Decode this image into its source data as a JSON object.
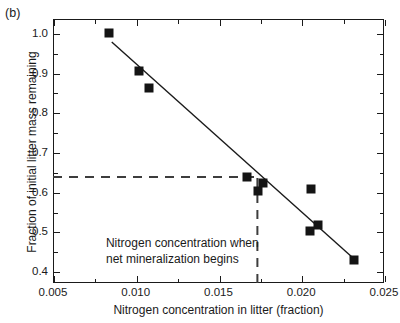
{
  "figure": {
    "panel_label": "(b)"
  },
  "chart_data": {
    "type": "scatter",
    "title": "",
    "xlabel": "Nitrogen concentration in litter (fraction)",
    "ylabel": "Fraction of initial litter mass remaining",
    "xlim": [
      0.005,
      0.025
    ],
    "ylim": [
      0.37,
      1.035
    ],
    "grid": false,
    "legend": null,
    "xticks": [
      0.005,
      0.01,
      0.015,
      0.02,
      0.025
    ],
    "xticklabels": [
      "0.005",
      "0.010",
      "0.015",
      "0.020",
      "0.025"
    ],
    "xminorticks": [
      0.0075,
      0.0125,
      0.0175,
      0.0225
    ],
    "yticks": [
      0.4,
      0.5,
      0.6,
      0.7,
      0.8,
      0.9,
      1.0
    ],
    "yticklabels": [
      "0.4",
      "0.5",
      "0.6",
      "0.7",
      "0.8",
      "0.9",
      "1.0"
    ],
    "yminorticks": [
      0.45,
      0.55,
      0.65,
      0.75,
      0.85,
      0.95
    ],
    "marker_style": "filled-square",
    "marker_color": "#141414",
    "points": [
      {
        "x": 0.0084,
        "y": 1.0
      },
      {
        "x": 0.0102,
        "y": 0.905
      },
      {
        "x": 0.0108,
        "y": 0.862
      },
      {
        "x": 0.0167,
        "y": 0.637
      },
      {
        "x": 0.0174,
        "y": 0.602
      },
      {
        "x": 0.0177,
        "y": 0.622
      },
      {
        "x": 0.0206,
        "y": 0.608
      },
      {
        "x": 0.0205,
        "y": 0.5
      },
      {
        "x": 0.021,
        "y": 0.515
      },
      {
        "x": 0.0232,
        "y": 0.427
      }
    ],
    "fit_line": {
      "style": "solid",
      "color": "#1a1a1a",
      "x0": 0.00855,
      "y0": 0.977,
      "x1": 0.02335,
      "y1": 0.425
    },
    "reference_lines": [
      {
        "name": "horizontal-threshold",
        "orientation": "horizontal",
        "value": 0.637,
        "style": "dashed",
        "color": "#3d3d3d",
        "from": 0.005,
        "to": 0.01735
      },
      {
        "name": "vertical-threshold",
        "orientation": "vertical",
        "value": 0.01735,
        "style": "dashed",
        "color": "#3d3d3d",
        "from": 0.37,
        "to": 0.637
      }
    ],
    "annotations": [
      {
        "name": "mineralization-note",
        "line1": "Nitrogen concentration when",
        "line2": "net mineralization begins",
        "x": 0.0082,
        "y": 0.472
      }
    ]
  }
}
